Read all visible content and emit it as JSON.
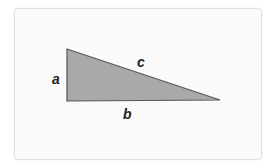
{
  "diagram": {
    "type": "right-triangle",
    "fill_color": "#a9a9a9",
    "stroke_color": "#555555",
    "vertices": {
      "top": [
        67,
        49
      ],
      "right_angle": [
        67,
        101
      ],
      "far": [
        220,
        100
      ]
    },
    "labels": {
      "a": "a",
      "b": "b",
      "c": "c"
    }
  }
}
